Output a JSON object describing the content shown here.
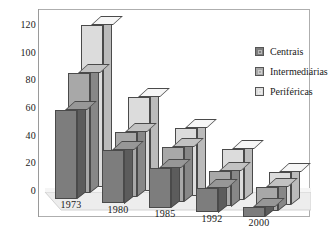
{
  "chart_data": {
    "type": "bar",
    "title": "",
    "subtitle": "",
    "xlabel": "",
    "ylabel": "",
    "categories": [
      "1973",
      "1980",
      "1985",
      "1992",
      "2000"
    ],
    "series": [
      {
        "name": "Centrais",
        "values": [
          64,
          39,
          29,
          18,
          7
        ],
        "color": "#7d7d7d"
      },
      {
        "name": "Intermediárias",
        "values": [
          87,
          47,
          40,
          26,
          17
        ],
        "color": "#a8a8a8"
      },
      {
        "name": "Periféricas",
        "values": [
          117,
          68,
          49,
          37,
          24
        ],
        "color": "#dcdcdc"
      }
    ],
    "ylim": [
      0,
      120
    ],
    "yticks": [
      0,
      20,
      40,
      60,
      80,
      100,
      120
    ],
    "ytick_labels": [
      "0",
      "20",
      "40",
      "60",
      "80",
      "100",
      "120"
    ],
    "grid": false,
    "legend_position": "upper-right",
    "style": "3d-grouped-columns"
  },
  "legend": {
    "entries": [
      {
        "label": "Centrais"
      },
      {
        "label": "Intermediárias"
      },
      {
        "label": "Periféricas"
      }
    ]
  },
  "colors": {
    "series_dark": "#7d7d7d",
    "series_mid": "#a8a8a8",
    "series_light": "#dcdcdc",
    "floor": "#ededed",
    "frame": "#aeaeae",
    "text": "#1a1a1a"
  }
}
